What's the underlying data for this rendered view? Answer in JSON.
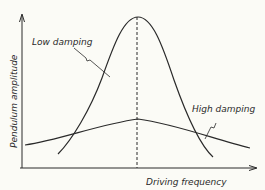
{
  "diagram": {
    "title": "",
    "y_axis_label": "Pendulum amplitude",
    "x_axis_label": "Driving frequency",
    "curves": [
      {
        "name": "Low damping",
        "description": "tall narrow resonance peak"
      },
      {
        "name": "High damping",
        "description": "low broad resonance peak"
      }
    ],
    "marker": "dashed vertical line at resonant frequency",
    "colors": {
      "ink": "#2a2a2a",
      "background": "#fbfbf6"
    }
  }
}
